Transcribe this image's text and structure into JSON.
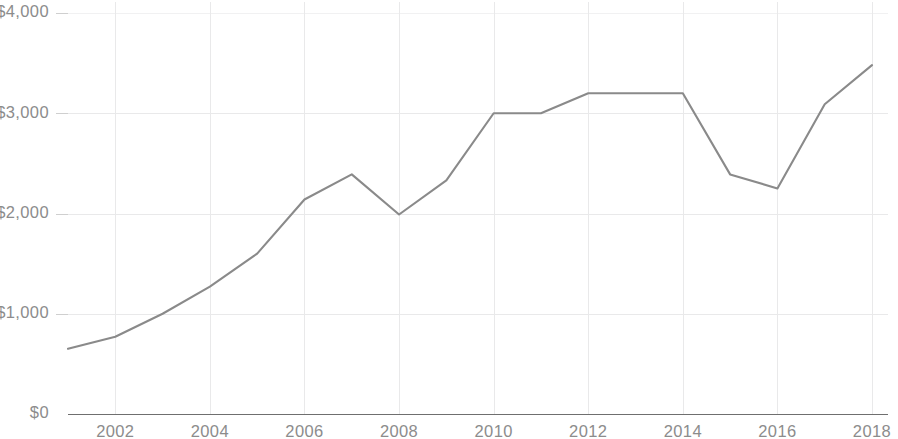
{
  "chart_data": {
    "type": "line",
    "title": "",
    "subtitle": "",
    "xlabel": "",
    "ylabel": "",
    "x": [
      2001,
      2002,
      2003,
      2004,
      2005,
      2006,
      2007,
      2008,
      2009,
      2010,
      2011,
      2012,
      2013,
      2014,
      2015,
      2016,
      2017,
      2018
    ],
    "series": [
      {
        "name": "Value",
        "color": "#8a8a8a",
        "values": [
          650,
          770,
          1000,
          1270,
          1600,
          2140,
          2390,
          1990,
          2330,
          3000,
          3000,
          3200,
          3200,
          3200,
          2390,
          2250,
          3090,
          3480
        ]
      }
    ],
    "xlim": [
      2001,
      2018
    ],
    "ylim": [
      0,
      4000
    ],
    "y_tick_values": [
      0,
      1000,
      2000,
      3000,
      4000
    ],
    "y_tick_labels": [
      "$0",
      "$1,000",
      "$2,000",
      "$3,000",
      "$4,000"
    ],
    "x_tick_values": [
      2002,
      2004,
      2006,
      2008,
      2010,
      2012,
      2014,
      2016,
      2018
    ],
    "x_tick_labels": [
      "2002",
      "2004",
      "2006",
      "2008",
      "2010",
      "2012",
      "2014",
      "2016",
      "2018"
    ],
    "grid": {
      "horizontal": true,
      "vertical": true,
      "color": "#e9e9ea"
    },
    "legend": {
      "visible": false,
      "position": "none",
      "entries": []
    },
    "annotations": [],
    "axis_line_color": "#6f6f6f",
    "tick_label_color": "#8c8c8c",
    "background_color": "#ffffff"
  },
  "y_axis": {
    "ticks": [
      {
        "label": "$4,000",
        "value": 4000
      },
      {
        "label": "$3,000",
        "value": 3000
      },
      {
        "label": "$2,000",
        "value": 2000
      },
      {
        "label": "$1,000",
        "value": 1000
      },
      {
        "label": "$0",
        "value": 0
      }
    ]
  },
  "x_axis": {
    "ticks": [
      {
        "label": "2002",
        "value": 2002
      },
      {
        "label": "2004",
        "value": 2004
      },
      {
        "label": "2006",
        "value": 2006
      },
      {
        "label": "2008",
        "value": 2008
      },
      {
        "label": "2010",
        "value": 2010
      },
      {
        "label": "2012",
        "value": 2012
      },
      {
        "label": "2014",
        "value": 2014
      },
      {
        "label": "2016",
        "value": 2016
      },
      {
        "label": "2018",
        "value": 2018
      }
    ]
  }
}
